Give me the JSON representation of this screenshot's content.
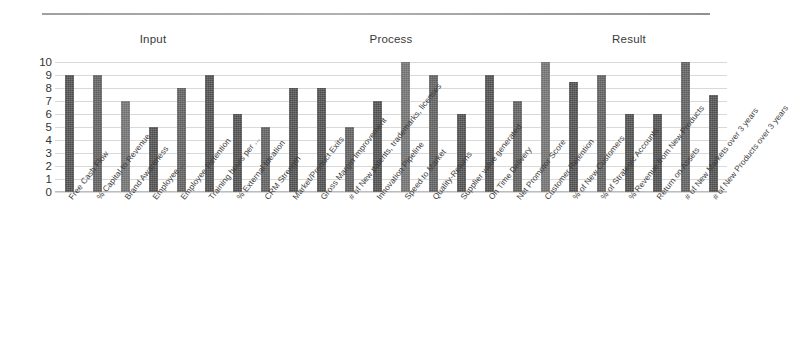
{
  "chart_data": {
    "type": "bar",
    "title": "",
    "xlabel": "",
    "ylabel": "",
    "ylim": [
      0,
      10
    ],
    "yticks": [
      0,
      1,
      2,
      3,
      4,
      5,
      6,
      7,
      8,
      9,
      10
    ],
    "grid": true,
    "legend": false,
    "group_headers": [
      "Input",
      "Process",
      "Result"
    ],
    "categories": [
      "Free Cash Flow",
      "% Capital to Revenue",
      "Brand Awareness",
      "Employee ...",
      "Employee Retention",
      "Training hours per ...",
      "% External Ideation",
      "CRM Strength",
      "Market/Product Exits",
      "Gross Margin Improvement",
      "# of New patents, trademarks, licenses",
      "Innovation Pipeline",
      "Speed to Market",
      "Quality-Returns",
      "Supplier value generated",
      "On Time Delivery",
      "Net Promotor Score",
      "Customer Retention",
      "% of New Customers",
      "% of Strategic Accounts",
      "% Revenue from New Products",
      "Return on Assets",
      "# of New Markets over 3 years",
      "# of New Products over 3 years"
    ],
    "values": [
      9,
      9,
      7,
      5,
      8,
      9,
      6,
      5,
      8,
      8,
      5,
      7,
      10,
      9,
      6,
      9,
      7,
      10,
      8.5,
      9,
      6,
      6,
      10,
      7.5
    ],
    "colors": {
      "bar_dark": "#4c4c4c",
      "bar_mid": "#5c5c5c",
      "bar_light": "#6e6e6e",
      "gridline": "#d9d9d9",
      "text": "#3d3d3d",
      "background": "#ffffff"
    }
  }
}
